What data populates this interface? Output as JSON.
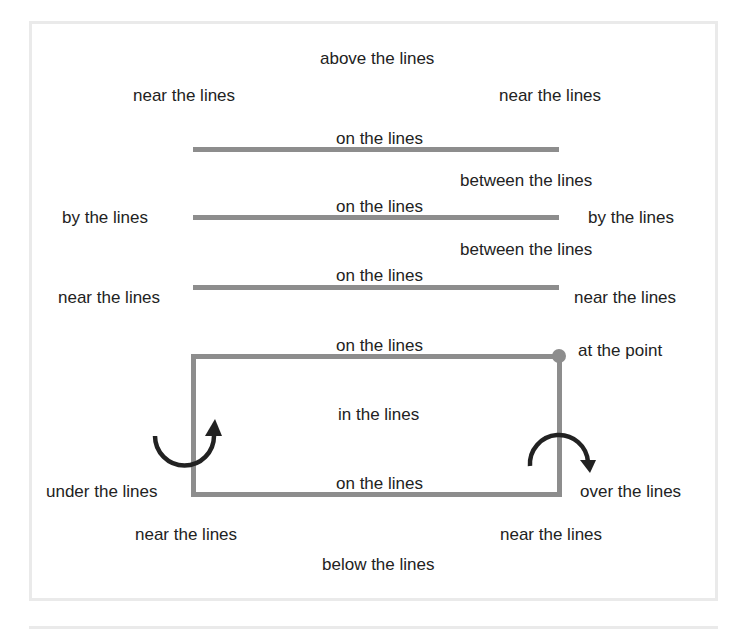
{
  "labels": {
    "above": "above the lines",
    "near_tl": "near the lines",
    "near_tr": "near the lines",
    "on_1": "on the lines",
    "between_1": "between the lines",
    "by_left": "by the lines",
    "on_2": "on the lines",
    "by_right": "by the lines",
    "between_2": "between the lines",
    "on_3": "on the lines",
    "near_ml": "near the lines",
    "near_mr": "near the lines",
    "on_box_top": "on the lines",
    "at_point": "at the point",
    "in": "in the lines",
    "under": "under the lines",
    "on_box_bottom": "on the lines",
    "over": "over the lines",
    "near_bl": "near the lines",
    "near_br": "near the lines",
    "below": "below the lines"
  },
  "colors": {
    "line": "#8d8d8d",
    "arrow": "#222222",
    "frame": "#eaeaea"
  }
}
